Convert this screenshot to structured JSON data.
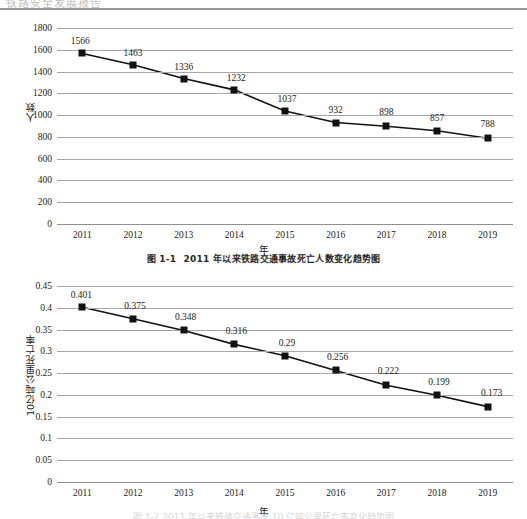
{
  "document": {
    "top_header_faint": "铁路安全发展报告",
    "bottom_caption_faint": "图 1-2  2011 年以来铁路交通事故 10 亿吨公里死亡率变化趋势图"
  },
  "figure_1": {
    "caption_number": "图 1-1",
    "caption_text": "2011 年以来铁路交通事故死亡人数变化趋势图"
  },
  "chart_data": [
    {
      "type": "line",
      "title": "",
      "xlabel": "年",
      "ylabel": "人数",
      "categories": [
        "2011",
        "2012",
        "2013",
        "2014",
        "2015",
        "2016",
        "2017",
        "2018",
        "2019"
      ],
      "values": [
        1566,
        1463,
        1336,
        1232,
        1037,
        932,
        898,
        857,
        788
      ],
      "data_labels": [
        "1566",
        "1463",
        "1336",
        "1232",
        "1037",
        "932",
        "898",
        "857",
        "788"
      ],
      "ylim": [
        0,
        1800
      ],
      "ytick_step": 200,
      "yticks": [
        "1800",
        "1600",
        "1400",
        "1200",
        "1000",
        "800",
        "600",
        "400",
        "200",
        "0"
      ],
      "ytick_values": [
        1800,
        1600,
        1400,
        1200,
        1000,
        800,
        600,
        400,
        200,
        0
      ],
      "grid": true,
      "legend": "none",
      "marker": "square",
      "line_color": "#111111",
      "grid_color": "#a6a6a6"
    },
    {
      "type": "line",
      "title": "",
      "xlabel": "年",
      "ylabel": "10亿吨公里死亡率",
      "categories": [
        "2011",
        "2012",
        "2013",
        "2014",
        "2015",
        "2016",
        "2017",
        "2018",
        "2019"
      ],
      "values": [
        0.401,
        0.375,
        0.348,
        0.316,
        0.29,
        0.256,
        0.222,
        0.199,
        0.173
      ],
      "data_labels": [
        "0.401",
        "0.375",
        "0.348",
        "0.316",
        "0.29",
        "0.256",
        "0.222",
        "0.199",
        "0.173"
      ],
      "ylim": [
        0,
        0.45
      ],
      "ytick_step": 0.05,
      "yticks": [
        "0.45",
        "0.4",
        "0.35",
        "0.3",
        "0.25",
        "0.2",
        "0.15",
        "0.1",
        "0.05",
        "0"
      ],
      "ytick_values": [
        0.45,
        0.4,
        0.35,
        0.3,
        0.25,
        0.2,
        0.15,
        0.1,
        0.05,
        0
      ],
      "grid": true,
      "legend": "none",
      "marker": "square",
      "line_color": "#111111",
      "grid_color": "#a6a6a6"
    }
  ]
}
